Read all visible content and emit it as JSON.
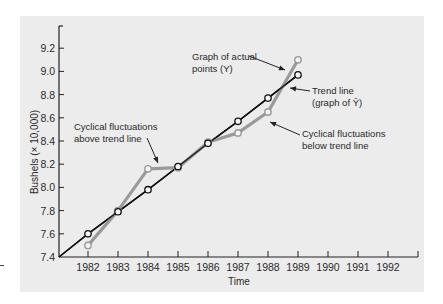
{
  "chart_data": {
    "type": "line",
    "title": "",
    "xlabel": "Time",
    "ylabel": "Bushels (× 10,000)",
    "x": [
      "1982",
      "1983",
      "1984",
      "1985",
      "1986",
      "1987",
      "1988",
      "1989"
    ],
    "x_ticks": [
      "1982",
      "1983",
      "1984",
      "1985",
      "1986",
      "1987",
      "1988",
      "1989",
      "1990",
      "1991",
      "1992"
    ],
    "y_ticks": [
      "7.4",
      "7.6",
      "7.8",
      "8.0",
      "8.2",
      "8.4",
      "8.6",
      "8.8",
      "9.0",
      "9.2"
    ],
    "ylim": [
      7.4,
      9.3
    ],
    "grid": false,
    "series": [
      {
        "name": "Graph of actual points (Y)",
        "color": "#9a9a9a",
        "values": [
          7.5,
          7.8,
          8.16,
          8.17,
          8.39,
          8.47,
          8.65,
          9.1
        ]
      },
      {
        "name": "Trend line (graph of Ŷ)",
        "color": "#111111",
        "values": [
          7.6,
          7.79,
          7.98,
          8.18,
          8.38,
          8.57,
          8.77,
          8.97
        ]
      }
    ],
    "annotations": [
      {
        "id": "actual",
        "lines": [
          "Graph of actual",
          "points (Y)"
        ]
      },
      {
        "id": "trend",
        "lines": [
          "Trend line",
          "(graph of Ŷ)"
        ]
      },
      {
        "id": "below",
        "lines": [
          "Cyclical fluctuations",
          "below trend line"
        ]
      },
      {
        "id": "above",
        "lines": [
          "Cyclical fluctuations",
          "above trend line"
        ]
      }
    ]
  },
  "colors": {
    "panel_bg": "#ececec",
    "actual_line": "#9a9a9a",
    "trend_line": "#111111"
  }
}
